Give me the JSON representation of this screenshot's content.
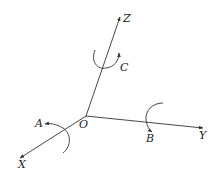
{
  "diagram": {
    "title": "",
    "origin": {
      "label": "O"
    },
    "axes": [
      {
        "id": "x",
        "label": "X"
      },
      {
        "id": "y",
        "label": "Y"
      },
      {
        "id": "z",
        "label": "Z"
      }
    ],
    "rotations": [
      {
        "id": "a",
        "label": "A",
        "about_axis": "X"
      },
      {
        "id": "b",
        "label": "B",
        "about_axis": "Y"
      },
      {
        "id": "c",
        "label": "C",
        "about_axis": "Z"
      }
    ],
    "colors": {
      "stroke": "#333333",
      "text": "#222222",
      "background": "#ffffff"
    }
  }
}
